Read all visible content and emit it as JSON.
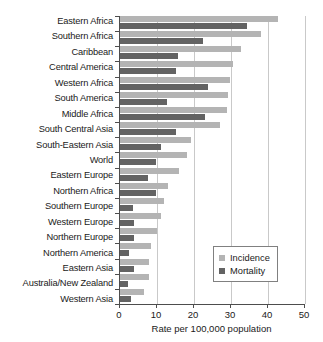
{
  "chart_data": {
    "type": "bar",
    "orientation": "horizontal",
    "title": "",
    "xlabel": "Rate per 100,000 population",
    "ylabel": "",
    "xlim": [
      0,
      50
    ],
    "xticks": [
      0,
      10,
      20,
      30,
      40,
      50
    ],
    "grid": "vertical",
    "legend_position": "lower-right",
    "categories": [
      "Eastern Africa",
      "Southern Africa",
      "Caribbean",
      "Central America",
      "Western Africa",
      "South America",
      "Middle Africa",
      "South Central Asia",
      "South-Eastern Asia",
      "World",
      "Eastern Europe",
      "Northern Africa",
      "Southern Europe",
      "Western Europe",
      "Northern Europe",
      "Northern America",
      "Eastern Asia",
      "Australia/New Zealand",
      "Western Asia"
    ],
    "series": [
      {
        "name": "Incidence",
        "color": "#b4b4b4",
        "values": [
          42.7,
          38.0,
          32.6,
          30.6,
          29.6,
          29.2,
          28.8,
          27.0,
          19.2,
          18.0,
          15.9,
          13.0,
          11.8,
          11.1,
          9.9,
          8.4,
          7.9,
          7.9,
          6.5
        ]
      },
      {
        "name": "Mortality",
        "color": "#636363",
        "values": [
          34.3,
          22.5,
          15.6,
          15.0,
          23.7,
          12.7,
          23.0,
          15.1,
          11.1,
          9.8,
          7.5,
          9.7,
          3.6,
          3.8,
          3.9,
          2.3,
          3.8,
          2.1,
          3.0
        ]
      }
    ]
  },
  "legend": {
    "entries": [
      {
        "label": "Incidence"
      },
      {
        "label": "Mortality"
      }
    ]
  }
}
